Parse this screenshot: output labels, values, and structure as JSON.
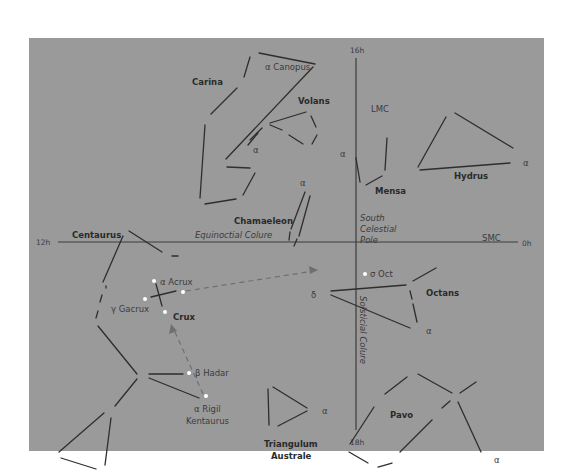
{
  "chart": {
    "background": "#9a9a9a",
    "line_color": "#2e2e2e",
    "star_color": "#ffffff",
    "guide_color": "#6f6f6f",
    "axes": {
      "top": "16h",
      "bottom": "18h",
      "left": "12h",
      "right": "0h",
      "horizontal_label": "Equinoctial Colure",
      "vertical_label": "Solsticial Colure",
      "center_label_line1": "South",
      "center_label_line2": "Celestial",
      "center_label_line3": "Pole"
    },
    "constellations": {
      "carina": "Carina",
      "volans": "Volans",
      "chamaeleon": "Chamaeleon",
      "mensa": "Mensa",
      "hydrus": "Hydrus",
      "centaurus": "Centaurus",
      "crux": "Crux",
      "octans": "Octans",
      "pavo": "Pavo",
      "triangulum_line1": "Triangulum",
      "triangulum_line2": "Australe"
    },
    "deep_sky": {
      "lmc": "LMC",
      "smc": "SMC"
    },
    "stars": {
      "canopus": "α Canopus",
      "acrux": "α  Acrux",
      "gacrux": "γ Gacrux",
      "hadar": "β Hadar",
      "rigil_line1": "α Rigil",
      "rigil_line2": "Kentaurus",
      "sigma_oct": "σ Oct",
      "delta_oct": "δ",
      "alpha_oct": "α",
      "alpha_volans": "α",
      "alpha_chamaeleon": "α",
      "alpha_mensa": "α",
      "alpha_hydrus": "α",
      "alpha_triangulum": "α",
      "alpha_pavo": "α"
    }
  }
}
